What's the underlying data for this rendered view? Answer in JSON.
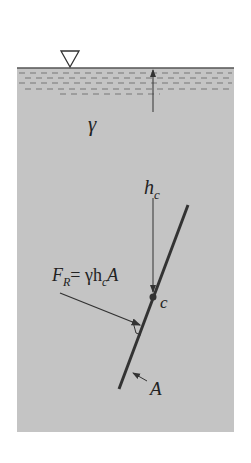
{
  "diagram": {
    "fluid_color": "#c4c4c4",
    "labels": {
      "specific_weight": "γ",
      "depth": "h",
      "depth_sub": "c",
      "centroid": "c",
      "area": "A",
      "force_lhs": "F",
      "force_sub": "R",
      "force_rhs": "= γh",
      "force_rhs_sub": "c",
      "force_rhs_tail": "A"
    }
  }
}
